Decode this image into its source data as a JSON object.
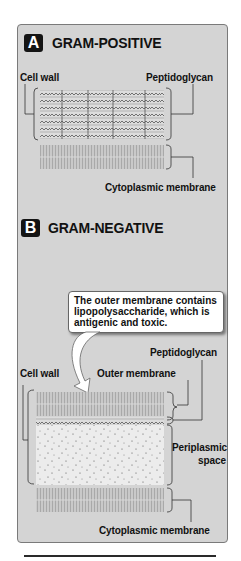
{
  "panel_a": {
    "badge": "A",
    "title": "GRAM-POSITIVE",
    "labels": {
      "cell_wall": "Cell wall",
      "peptidoglycan": "Peptidoglycan",
      "cytoplasmic_membrane": "Cytoplasmic membrane"
    },
    "peptidoglycan_layers": 7
  },
  "panel_b": {
    "badge": "B",
    "title": "GRAM-NEGATIVE",
    "callout": "The outer membrane contains lipopolysaccharide, which is antigenic and toxic.",
    "labels": {
      "peptidoglycan": "Peptidoglycan",
      "cell_wall": "Cell wall",
      "outer_membrane": "Outer membrane",
      "periplasmic_space_line1": "Periplasmic",
      "periplasmic_space_line2": "space",
      "cytoplasmic_membrane": "Cytoplasmic membrane"
    },
    "peptidoglycan_layers": 1
  },
  "colors": {
    "panel_bg": "#d4d4d4",
    "badge_bg": "#141414",
    "membrane": "#bdbdbd",
    "periplasm": "#ececec",
    "text": "#111111"
  }
}
